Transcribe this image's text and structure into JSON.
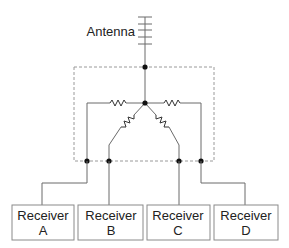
{
  "diagram": {
    "antenna_label": "Antenna",
    "receivers": [
      {
        "line1": "Receiver",
        "line2": "A"
      },
      {
        "line1": "Receiver",
        "line2": "B"
      },
      {
        "line1": "Receiver",
        "line2": "C"
      },
      {
        "line1": "Receiver",
        "line2": "D"
      }
    ]
  }
}
